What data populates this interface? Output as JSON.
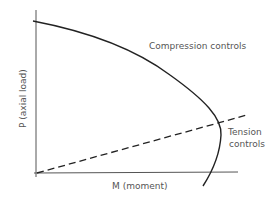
{
  "diagram": {
    "y_axis_label": "P (axial load)",
    "x_axis_label": "M (moment)",
    "annotations": {
      "compression": "Compression controls",
      "tension_line1": "Tension",
      "tension_line2": "controls"
    },
    "colors": {
      "curve": "#222222",
      "axes": "#444444",
      "text": "#555555"
    }
  }
}
